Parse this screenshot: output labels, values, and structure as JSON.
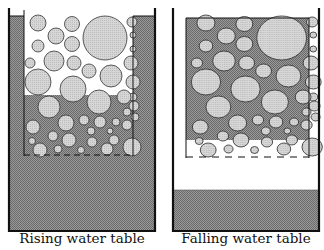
{
  "diagrams": [
    {
      "id": "rising",
      "caption": "Rising water table",
      "x": 8,
      "inner_left": 24,
      "inner_right": 133,
      "right": 156,
      "water_fill_top": 95,
      "dash_y": 155,
      "bottom_water_top": 160,
      "side_water_top": 16,
      "background": "white-top-gray-bottom"
    },
    {
      "id": "falling",
      "caption": "Falling water table",
      "x": 172,
      "inner_left": 186,
      "inner_right": 309,
      "right": 320,
      "water_fill_top": 18,
      "water_fill_bottom": 140,
      "dash_y": 157,
      "bottom_water_top": 190,
      "background": "gray-top-white-bottom"
    }
  ],
  "colors": {
    "water": "#8a8a8a",
    "particle": "#cfcfcf",
    "particle_stroke": "#333333",
    "wall": "#111111",
    "paper": "#ffffff"
  }
}
